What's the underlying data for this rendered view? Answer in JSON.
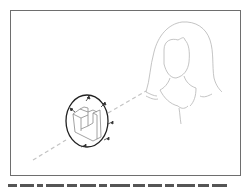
{
  "figure": {
    "colors": {
      "frame": "#6e6e6e",
      "sketch": "#b5b5b5",
      "oval": "#222222",
      "dash": "#c4c4c4",
      "block": "#8a8a8a",
      "arrows": "#333333"
    },
    "elements": {
      "woman_head": "woman-head-outline",
      "sight_line": "dashed-sight-line",
      "lens": "oval-lens",
      "object": "isometric-stepped-block",
      "arrows_count": 6
    }
  },
  "caption": {
    "text": "",
    "clipped": true
  }
}
